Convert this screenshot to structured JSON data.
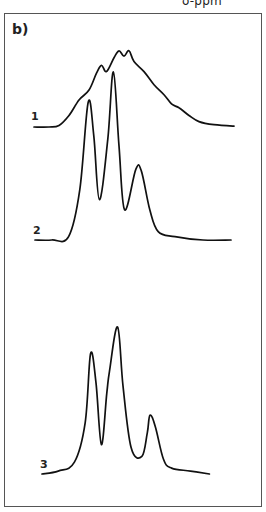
{
  "header": {
    "axis_label": "δ-ppm"
  },
  "panel": {
    "label": "b)"
  },
  "chart_data": {
    "type": "line",
    "title": "b)",
    "xlabel": "δ-ppm",
    "ylabel": "",
    "grid": false,
    "legend": "none",
    "x_units": "relative chemical shift (0 = left, 1 = right of frame)",
    "series": [
      {
        "name": "1",
        "label": "1",
        "offset": 0,
        "points": [
          [
            0.0,
            0.0
          ],
          [
            0.06,
            0.0
          ],
          [
            0.1,
            0.02
          ],
          [
            0.14,
            0.15
          ],
          [
            0.18,
            0.35
          ],
          [
            0.22,
            0.48
          ],
          [
            0.25,
            0.7
          ],
          [
            0.27,
            0.8
          ],
          [
            0.29,
            0.72
          ],
          [
            0.32,
            0.9
          ],
          [
            0.34,
            0.99
          ],
          [
            0.36,
            0.92
          ],
          [
            0.38,
            0.99
          ],
          [
            0.4,
            0.85
          ],
          [
            0.44,
            0.72
          ],
          [
            0.48,
            0.55
          ],
          [
            0.52,
            0.42
          ],
          [
            0.55,
            0.3
          ],
          [
            0.58,
            0.25
          ],
          [
            0.62,
            0.15
          ],
          [
            0.66,
            0.07
          ],
          [
            0.72,
            0.03
          ],
          [
            0.8,
            0.01
          ]
        ]
      },
      {
        "name": "2",
        "label": "2",
        "offset": 0,
        "points": [
          [
            0.0,
            0.0
          ],
          [
            0.06,
            0.0
          ],
          [
            0.12,
            0.02
          ],
          [
            0.16,
            0.3
          ],
          [
            0.19,
            0.82
          ],
          [
            0.21,
            0.62
          ],
          [
            0.23,
            0.24
          ],
          [
            0.26,
            0.6
          ],
          [
            0.28,
            1.0
          ],
          [
            0.3,
            0.56
          ],
          [
            0.32,
            0.18
          ],
          [
            0.36,
            0.42
          ],
          [
            0.38,
            0.41
          ],
          [
            0.41,
            0.18
          ],
          [
            0.44,
            0.05
          ],
          [
            0.5,
            0.02
          ],
          [
            0.6,
            0.0
          ],
          [
            0.7,
            0.0
          ]
        ]
      },
      {
        "name": "3",
        "label": "3",
        "offset": 0,
        "points": [
          [
            0.0,
            0.0
          ],
          [
            0.06,
            0.02
          ],
          [
            0.12,
            0.08
          ],
          [
            0.16,
            0.35
          ],
          [
            0.18,
            0.82
          ],
          [
            0.2,
            0.62
          ],
          [
            0.22,
            0.2
          ],
          [
            0.24,
            0.55
          ],
          [
            0.25,
            0.7
          ],
          [
            0.28,
            1.0
          ],
          [
            0.3,
            0.6
          ],
          [
            0.33,
            0.18
          ],
          [
            0.37,
            0.12
          ],
          [
            0.39,
            0.28
          ],
          [
            0.4,
            0.4
          ],
          [
            0.42,
            0.32
          ],
          [
            0.45,
            0.1
          ],
          [
            0.48,
            0.04
          ],
          [
            0.55,
            0.02
          ],
          [
            0.62,
            0.0
          ]
        ]
      }
    ]
  }
}
